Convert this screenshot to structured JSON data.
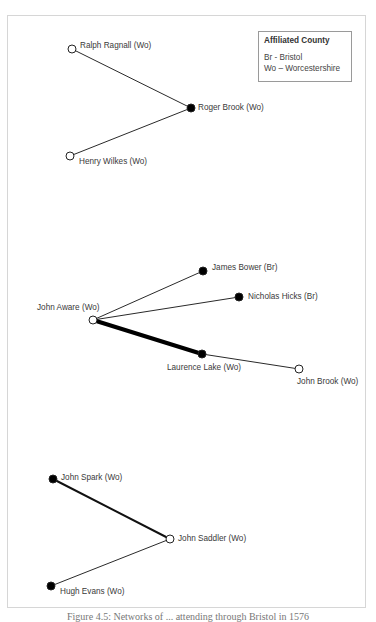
{
  "legend": {
    "title": "Affiliated County",
    "entries": [
      {
        "code": "Br",
        "label": "Br - Bristol"
      },
      {
        "code": "Wo",
        "label": "Wo – Worcestershire"
      }
    ]
  },
  "colors": {
    "edge": "#2a2a2a",
    "node_filled": "#000000",
    "node_hollow_fill": "#ffffff",
    "label": "#3a3a3a",
    "frame": "#d6d6d6",
    "legend_border": "#9a9a9a"
  },
  "nodes": [
    {
      "id": "ralph",
      "label": "Ralph Ragnall (Wo)",
      "filled": false,
      "x": 72,
      "y": 49
    },
    {
      "id": "roger",
      "label": "Roger Brook (Wo)",
      "filled": true,
      "x": 191,
      "y": 108
    },
    {
      "id": "henry",
      "label": "Henry Wilkes (Wo)",
      "filled": false,
      "x": 70,
      "y": 156
    },
    {
      "id": "james",
      "label": "James Bower (Br)",
      "filled": true,
      "x": 203,
      "y": 271
    },
    {
      "id": "nicholas",
      "label": "Nicholas Hicks (Br)",
      "filled": true,
      "x": 239,
      "y": 297
    },
    {
      "id": "aware",
      "label": "John Aware (Wo)",
      "filled": false,
      "x": 93,
      "y": 320
    },
    {
      "id": "laurence",
      "label": "Laurence Lake (Wo)",
      "filled": true,
      "x": 202,
      "y": 354
    },
    {
      "id": "jbrook",
      "label": "John Brook (Wo)",
      "filled": false,
      "x": 299,
      "y": 369
    },
    {
      "id": "spark",
      "label": "John Spark (Wo)",
      "filled": true,
      "x": 53,
      "y": 479
    },
    {
      "id": "saddler",
      "label": "John Saddler (Wo)",
      "filled": false,
      "x": 170,
      "y": 539
    },
    {
      "id": "hugh",
      "label": "Hugh Evans (Wo)",
      "filled": true,
      "x": 51,
      "y": 586
    }
  ],
  "edges": [
    {
      "from": "ralph",
      "to": "roger",
      "weight": 1
    },
    {
      "from": "henry",
      "to": "roger",
      "weight": 1
    },
    {
      "from": "aware",
      "to": "james",
      "weight": 1
    },
    {
      "from": "aware",
      "to": "nicholas",
      "weight": 1
    },
    {
      "from": "aware",
      "to": "laurence",
      "weight": 4
    },
    {
      "from": "laurence",
      "to": "jbrook",
      "weight": 1
    },
    {
      "from": "spark",
      "to": "saddler",
      "weight": 2
    },
    {
      "from": "hugh",
      "to": "saddler",
      "weight": 1
    }
  ],
  "caption": "Figure 4.5: Networks of ... attending through Bristol in 1576"
}
